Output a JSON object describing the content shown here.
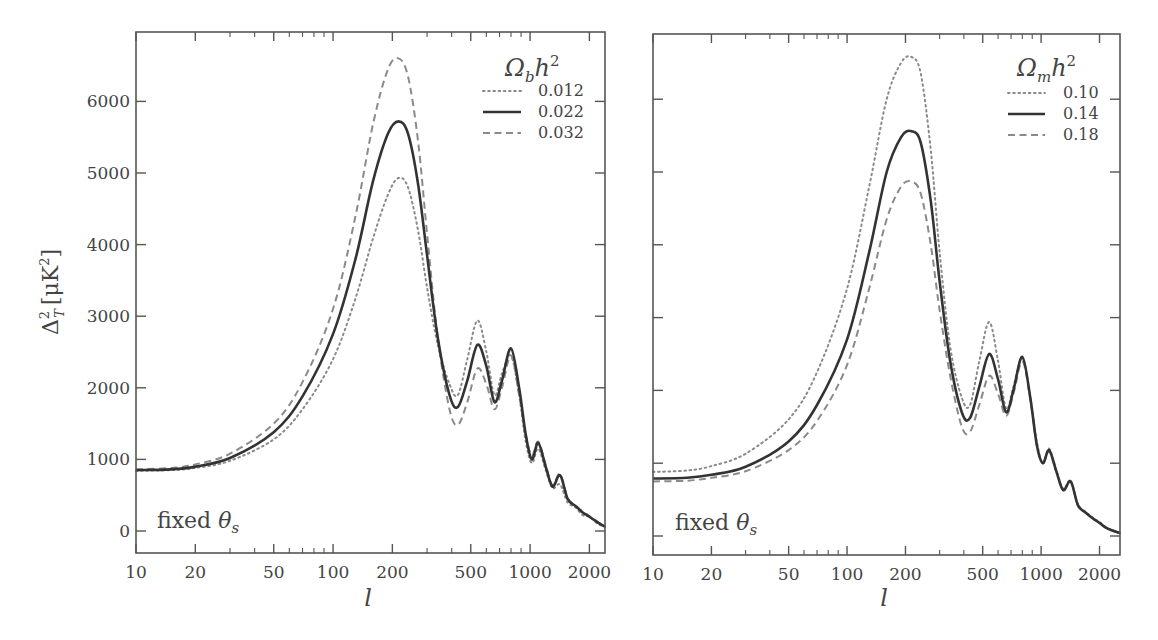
{
  "chart_data": [
    {
      "type": "line",
      "title": "",
      "xlabel": "l",
      "ylabel": "Δ²_T [μK²]",
      "xscale": "log",
      "xlim": [
        10,
        2400
      ],
      "ylim": [
        -300,
        6900
      ],
      "xticks": [
        10,
        20,
        50,
        100,
        200,
        500,
        1000,
        2000
      ],
      "yticks": [
        0,
        1000,
        2000,
        3000,
        4000,
        5000,
        6000
      ],
      "annotation": "fixed θ_s",
      "legend": {
        "title": "Ω_b h²",
        "position": "upper right"
      },
      "series": [
        {
          "name": "0.012",
          "style": "dotted",
          "color": "#8a8a8a",
          "x": [
            10,
            15,
            20,
            30,
            50,
            70,
            100,
            130,
            160,
            190,
            215,
            240,
            270,
            300,
            340,
            390,
            430,
            480,
            540,
            600,
            660,
            720,
            800,
            880,
            950,
            1020,
            1100,
            1200,
            1300,
            1420,
            1550,
            1700,
            1850,
            2000,
            2200,
            2400
          ],
          "y": [
            840,
            850,
            880,
            980,
            1280,
            1700,
            2400,
            3250,
            4100,
            4700,
            4930,
            4800,
            4200,
            3400,
            2600,
            2050,
            1900,
            2400,
            2940,
            2500,
            1900,
            2200,
            2450,
            1900,
            1250,
            950,
            1150,
            850,
            600,
            650,
            400,
            330,
            220,
            200,
            100,
            60
          ]
        },
        {
          "name": "0.022",
          "style": "solid",
          "color": "#333333",
          "x": [
            10,
            15,
            20,
            30,
            50,
            70,
            100,
            130,
            160,
            190,
            215,
            240,
            270,
            300,
            340,
            390,
            430,
            480,
            540,
            600,
            660,
            720,
            800,
            880,
            950,
            1020,
            1100,
            1200,
            1300,
            1420,
            1550,
            1700,
            1850,
            2000,
            2200,
            2400
          ],
          "y": [
            850,
            860,
            900,
            1020,
            1380,
            1880,
            2750,
            3800,
            4900,
            5550,
            5720,
            5550,
            4850,
            3850,
            2700,
            1900,
            1730,
            2100,
            2600,
            2300,
            1800,
            2100,
            2550,
            2000,
            1350,
            1000,
            1230,
            900,
            620,
            780,
            450,
            350,
            260,
            200,
            120,
            60
          ]
        },
        {
          "name": "0.032",
          "style": "dashed",
          "color": "#8a8a8a",
          "x": [
            10,
            15,
            20,
            30,
            50,
            70,
            100,
            130,
            160,
            190,
            215,
            240,
            270,
            300,
            340,
            390,
            430,
            480,
            540,
            600,
            660,
            720,
            800,
            880,
            950,
            1020,
            1100,
            1200,
            1300,
            1420,
            1550,
            1700,
            1850,
            2000,
            2200,
            2400
          ],
          "y": [
            860,
            880,
            930,
            1080,
            1500,
            2080,
            3100,
            4400,
            5700,
            6450,
            6600,
            6350,
            5450,
            4150,
            2700,
            1700,
            1480,
            1800,
            2270,
            2050,
            1700,
            2000,
            2450,
            1900,
            1350,
            1050,
            1250,
            920,
            640,
            800,
            460,
            360,
            270,
            210,
            130,
            60
          ]
        }
      ]
    },
    {
      "type": "line",
      "title": "",
      "xlabel": "l",
      "ylabel": "",
      "xscale": "log",
      "xlim": [
        10,
        2550
      ],
      "ylim": [
        -270,
        6900
      ],
      "xticks": [
        10,
        20,
        50,
        100,
        200,
        500,
        1000,
        2000
      ],
      "yticks": [
        0,
        1000,
        2000,
        3000,
        4000,
        5000,
        6000
      ],
      "annotation": "fixed θ_s",
      "legend": {
        "title": "Ω_m h²",
        "position": "upper right"
      },
      "series": [
        {
          "name": "0.10",
          "style": "dotted",
          "color": "#8a8a8a",
          "x": [
            10,
            15,
            20,
            30,
            50,
            70,
            100,
            130,
            160,
            190,
            215,
            240,
            270,
            300,
            340,
            390,
            430,
            480,
            540,
            600,
            660,
            720,
            800,
            880,
            950,
            1020,
            1100,
            1200,
            1300,
            1420,
            1550,
            1700,
            1850,
            2000,
            2200,
            2550
          ],
          "y": [
            880,
            900,
            960,
            1130,
            1600,
            2250,
            3400,
            4800,
            6000,
            6500,
            6580,
            6350,
            5300,
            3900,
            2600,
            1900,
            1800,
            2400,
            2940,
            2400,
            1750,
            2050,
            2450,
            1900,
            1300,
            1000,
            1200,
            900,
            650,
            760,
            430,
            330,
            250,
            190,
            110,
            40
          ]
        },
        {
          "name": "0.14",
          "style": "solid",
          "color": "#333333",
          "x": [
            10,
            15,
            20,
            30,
            50,
            70,
            100,
            130,
            160,
            190,
            215,
            240,
            270,
            300,
            340,
            390,
            430,
            480,
            540,
            600,
            660,
            720,
            800,
            880,
            950,
            1020,
            1100,
            1200,
            1300,
            1420,
            1550,
            1700,
            1850,
            2000,
            2200,
            2550
          ],
          "y": [
            790,
            800,
            840,
            950,
            1300,
            1800,
            2700,
            3900,
            5000,
            5480,
            5560,
            5400,
            4600,
            3500,
            2400,
            1700,
            1620,
            2050,
            2500,
            2150,
            1700,
            2000,
            2460,
            1900,
            1250,
            1000,
            1180,
            880,
            630,
            750,
            420,
            320,
            240,
            180,
            100,
            40
          ]
        },
        {
          "name": "0.18",
          "style": "dashed",
          "color": "#8a8a8a",
          "x": [
            10,
            15,
            20,
            30,
            50,
            70,
            100,
            130,
            160,
            190,
            215,
            240,
            270,
            300,
            340,
            390,
            430,
            480,
            540,
            600,
            660,
            720,
            800,
            880,
            950,
            1020,
            1100,
            1200,
            1300,
            1420,
            1550,
            1700,
            1850,
            2000,
            2200,
            2550
          ],
          "y": [
            750,
            760,
            800,
            890,
            1180,
            1580,
            2350,
            3400,
            4350,
            4800,
            4870,
            4700,
            4000,
            3100,
            2200,
            1500,
            1430,
            1800,
            2200,
            1950,
            1650,
            1950,
            2400,
            1880,
            1250,
            1000,
            1170,
            880,
            630,
            750,
            420,
            320,
            240,
            180,
            100,
            40
          ]
        }
      ]
    }
  ],
  "left_panel": {
    "ylabel": "Δ²_T [μK²]",
    "xlabel": "l",
    "annotation": "fixed θs",
    "legend_title": "Ωbh²",
    "legend_items": [
      "0.012",
      "0.022",
      "0.032"
    ],
    "xtick_labels": [
      "10",
      "20",
      "50",
      "100",
      "200",
      "500",
      "1000",
      "2000"
    ],
    "ytick_labels": [
      "0",
      "1000",
      "2000",
      "3000",
      "4000",
      "5000",
      "6000"
    ]
  },
  "right_panel": {
    "xlabel": "l",
    "annotation": "fixed θs",
    "legend_title": "Ωmh²",
    "legend_items": [
      "0.10",
      "0.14",
      "0.18"
    ],
    "xtick_labels": [
      "10",
      "20",
      "50",
      "100",
      "200",
      "500",
      "1000",
      "2000"
    ]
  }
}
